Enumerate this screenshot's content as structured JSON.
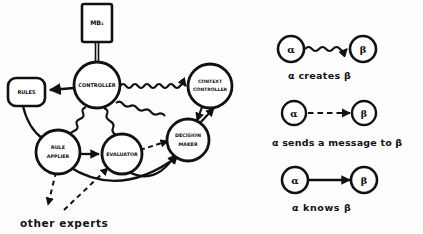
{
  "figure": {
    "background_color": "#fdfdfd",
    "ink_color": "#111111"
  },
  "diagram": {
    "title_box": {
      "label": "MB₁"
    },
    "nodes": [
      {
        "id": "mb1",
        "label": "MB₁",
        "shape": "rectangle",
        "x": 97,
        "y": 22
      },
      {
        "id": "controller",
        "label": "CONTROLLER",
        "shape": "circle",
        "x": 97,
        "y": 85
      },
      {
        "id": "rules",
        "label": "RULES",
        "shape": "rounded-rectangle",
        "x": 26,
        "y": 92
      },
      {
        "id": "context-controller",
        "label": "CONTEXT CONTROLLER",
        "shape": "circle",
        "x": 210,
        "y": 86
      },
      {
        "id": "rule-applier",
        "label": "RULE APPLIER",
        "shape": "circle",
        "x": 58,
        "y": 152
      },
      {
        "id": "evaluator",
        "label": "EVALUATOR",
        "shape": "circle",
        "x": 122,
        "y": 154
      },
      {
        "id": "decision-maker",
        "label": "DECISION MAKER",
        "shape": "circle",
        "x": 188,
        "y": 140
      }
    ],
    "node_label_lines": {
      "mb1": [
        "MB₁"
      ],
      "controller": [
        "CONTROLLER"
      ],
      "rules": [
        "RULES"
      ],
      "context-controller": [
        "CONTEXT",
        "CONTROLLER"
      ],
      "rule-applier": [
        "RULE",
        "APPLIER"
      ],
      "evaluator": [
        "EVALUATOR"
      ],
      "decision-maker": [
        "DECISION",
        "MAKER"
      ]
    },
    "edges": [
      {
        "from": "mb1",
        "to": "controller",
        "style": "double-line",
        "relation": "knows"
      },
      {
        "from": "controller",
        "to": "rules",
        "style": "solid",
        "relation": "knows"
      },
      {
        "from": "controller",
        "to": "context-controller",
        "style": "wavy",
        "relation": "creates"
      },
      {
        "from": "controller",
        "to": "rule-applier",
        "style": "wavy",
        "relation": "creates"
      },
      {
        "from": "controller",
        "to": "evaluator",
        "style": "wavy",
        "relation": "creates"
      },
      {
        "from": "controller",
        "to": "decision-maker",
        "style": "wavy",
        "relation": "creates"
      },
      {
        "from": "rules",
        "to": "rule-applier",
        "style": "solid",
        "relation": "knows"
      },
      {
        "from": "rule-applier",
        "to": "evaluator",
        "style": "solid",
        "relation": "knows"
      },
      {
        "from": "rule-applier",
        "to": "decision-maker",
        "style": "solid-arc",
        "relation": "knows"
      },
      {
        "from": "evaluator",
        "to": "decision-maker",
        "style": "solid-arc",
        "relation": "knows"
      },
      {
        "from": "evaluator",
        "to": "decision-maker",
        "style": "dashed",
        "relation": "sends a message"
      },
      {
        "from": "decision-maker",
        "to": "context-controller",
        "style": "solid",
        "relation": "knows"
      },
      {
        "from": "context-controller",
        "to": "decision-maker",
        "style": "solid",
        "relation": "knows"
      },
      {
        "from": "rule-applier",
        "to": "other-experts",
        "style": "dashed",
        "relation": "sends a message"
      },
      {
        "from": "other-experts",
        "to": "evaluator",
        "style": "dashed",
        "relation": "sends a message"
      }
    ],
    "caption": {
      "other_experts": "other experts"
    }
  },
  "legend": {
    "rows": [
      {
        "id": "creates",
        "style": "wavy",
        "source_label": "α",
        "target_label": "β",
        "caption": "α creates β"
      },
      {
        "id": "sends-message",
        "style": "dashed",
        "source_label": "α",
        "target_label": "β",
        "caption": "α sends a message to β"
      },
      {
        "id": "knows",
        "style": "solid",
        "source_label": "α",
        "target_label": "β",
        "caption": "α knows β"
      }
    ]
  }
}
